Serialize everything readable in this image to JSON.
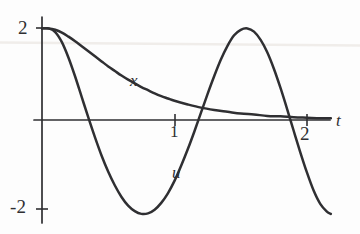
{
  "figure": {
    "background_color": "#fdfdfd",
    "ink_color": "#2f2f32",
    "scan_artifact_color": "#f0eeec"
  },
  "chart_data": {
    "type": "line",
    "title": "",
    "subtitle": "",
    "xlabel": "t",
    "ylabel": "",
    "xlim": [
      -0.06,
      2.18
    ],
    "ylim": [
      -2.25,
      2.25
    ],
    "grid": false,
    "legend": "inline-curve-labels",
    "annotations": [
      {
        "text": "x",
        "x": 0.7,
        "y": 1.0,
        "style": "italic",
        "role": "curve-label"
      },
      {
        "text": "u",
        "x": 1.02,
        "y": -0.95,
        "style": "italic",
        "role": "curve-label"
      }
    ],
    "axes": {
      "x_axis": {
        "label": "t",
        "tick_values": [
          1,
          2
        ],
        "tick_labels": [
          "1",
          "2"
        ],
        "tick_label_position": "below-axis",
        "draw_from": -0.06,
        "draw_to": 2.18,
        "arrow": false
      },
      "y_axis": {
        "label": "",
        "tick_values": [
          2,
          -2
        ],
        "tick_labels": [
          "2",
          "-2"
        ],
        "tick_label_position": "left-of-axis",
        "draw_from": -2.22,
        "draw_to": 2.22,
        "arrow": false
      }
    },
    "series": [
      {
        "name": "x",
        "label": "x",
        "description": "monotonically decaying curve from 2 toward 0",
        "color": "#2f2f32",
        "x": [
          0.0,
          0.05,
          0.1,
          0.15,
          0.2,
          0.25,
          0.3,
          0.35,
          0.4,
          0.45,
          0.5,
          0.55,
          0.6,
          0.65,
          0.7,
          0.75,
          0.8,
          0.85,
          0.9,
          0.95,
          1.0,
          1.1,
          1.2,
          1.3,
          1.4,
          1.5,
          1.6,
          1.7,
          1.8,
          1.9,
          2.0,
          2.1,
          2.18
        ],
        "values": [
          2.0,
          2.0,
          1.97,
          1.91,
          1.82,
          1.72,
          1.61,
          1.5,
          1.39,
          1.28,
          1.17,
          1.07,
          0.97,
          0.88,
          0.8,
          0.72,
          0.65,
          0.58,
          0.52,
          0.47,
          0.42,
          0.34,
          0.27,
          0.22,
          0.18,
          0.14,
          0.12,
          0.09,
          0.08,
          0.06,
          0.05,
          0.04,
          0.04
        ]
      },
      {
        "name": "u",
        "label": "u",
        "description": "damped oscillating curve starting at 2",
        "color": "#2f2f32",
        "x": [
          0.0,
          0.05,
          0.1,
          0.15,
          0.2,
          0.25,
          0.3,
          0.35,
          0.4,
          0.45,
          0.5,
          0.55,
          0.6,
          0.65,
          0.7,
          0.75,
          0.8,
          0.85,
          0.9,
          0.95,
          1.0,
          1.05,
          1.1,
          1.15,
          1.2,
          1.25,
          1.3,
          1.35,
          1.4,
          1.45,
          1.5,
          1.55,
          1.6,
          1.65,
          1.7,
          1.75,
          1.8,
          1.85,
          1.9,
          1.95,
          2.0,
          2.05,
          2.1,
          2.15,
          2.18
        ],
        "values": [
          2.0,
          2.0,
          1.92,
          1.7,
          1.36,
          0.95,
          0.5,
          0.05,
          -0.38,
          -0.78,
          -1.13,
          -1.43,
          -1.68,
          -1.87,
          -1.99,
          -2.05,
          -2.04,
          -1.96,
          -1.81,
          -1.6,
          -1.33,
          -1.0,
          -0.64,
          -0.25,
          0.16,
          0.57,
          0.96,
          1.32,
          1.62,
          1.85,
          1.97,
          2.0,
          1.93,
          1.75,
          1.48,
          1.12,
          0.7,
          0.24,
          -0.24,
          -0.71,
          -1.15,
          -1.54,
          -1.83,
          -2.0,
          -2.05
        ]
      }
    ],
    "key_points": {
      "x_curve": {
        "initial_value": 2,
        "limit": 0
      },
      "u_curve": {
        "initial_value": 2,
        "zero_crossings": [
          0.36,
          1.17,
          1.87
        ],
        "minimum": {
          "t": 0.75,
          "value": -2.05
        },
        "maximum": {
          "t": 1.53,
          "value": 2.0
        }
      }
    }
  }
}
